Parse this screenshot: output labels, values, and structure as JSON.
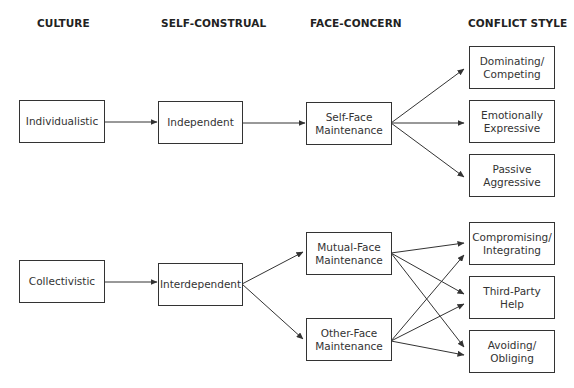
{
  "headers": {
    "culture": "CULTURE",
    "self_construal": "SELF-CONSTRUAL",
    "face_concern": "FACE-CONCERN",
    "conflict_style": "CONFLICT STYLE"
  },
  "nodes": {
    "individualistic": "Individualistic",
    "collectivistic": "Collectivistic",
    "independent": "Independent",
    "interdependent": "Interdependent",
    "self_face_1": "Self-Face",
    "self_face_2": "Maintenance",
    "mutual_face_1": "Mutual-Face",
    "mutual_face_2": "Maintenance",
    "other_face_1": "Other-Face",
    "other_face_2": "Maintenance",
    "dominating_1": "Dominating/",
    "dominating_2": "Competing",
    "emotional_1": "Emotionally",
    "emotional_2": "Expressive",
    "passive_1": "Passive",
    "passive_2": "Aggressive",
    "compromising_1": "Compromising/",
    "compromising_2": "Integrating",
    "third_party_1": "Third-Party",
    "third_party_2": "Help",
    "avoiding_1": "Avoiding/",
    "avoiding_2": "Obliging"
  },
  "edges": [
    [
      "Individualistic",
      "Independent"
    ],
    [
      "Independent",
      "Self-Face Maintenance"
    ],
    [
      "Self-Face Maintenance",
      "Dominating/Competing"
    ],
    [
      "Self-Face Maintenance",
      "Emotionally Expressive"
    ],
    [
      "Self-Face Maintenance",
      "Passive Aggressive"
    ],
    [
      "Collectivistic",
      "Interdependent"
    ],
    [
      "Interdependent",
      "Mutual-Face Maintenance"
    ],
    [
      "Interdependent",
      "Other-Face Maintenance"
    ],
    [
      "Mutual-Face Maintenance",
      "Compromising/Integrating"
    ],
    [
      "Mutual-Face Maintenance",
      "Third-Party Help"
    ],
    [
      "Mutual-Face Maintenance",
      "Avoiding/Obliging"
    ],
    [
      "Other-Face Maintenance",
      "Compromising/Integrating"
    ],
    [
      "Other-Face Maintenance",
      "Third-Party Help"
    ],
    [
      "Other-Face Maintenance",
      "Avoiding/Obliging"
    ]
  ],
  "colors": {
    "line": "#333333",
    "text": "#333333",
    "background": "#ffffff"
  }
}
